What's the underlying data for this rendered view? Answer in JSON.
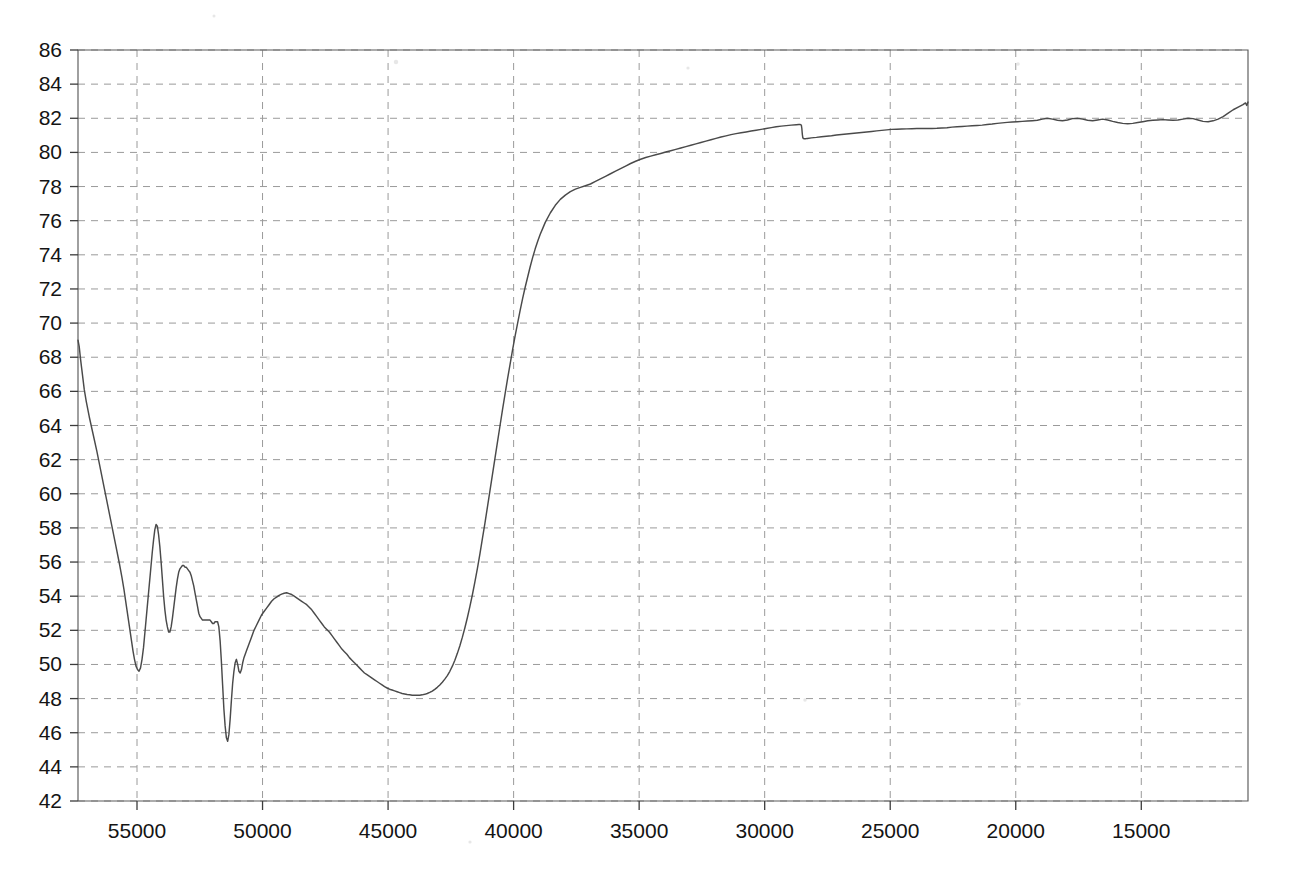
{
  "chart_data": {
    "type": "line",
    "title": "",
    "subtitle": "",
    "xlabel": "",
    "ylabel": "",
    "xlim": [
      57350,
      10750
    ],
    "ylim": [
      42,
      86
    ],
    "x_axis_reversed": true,
    "grid": true,
    "legend": null,
    "legend_position": "none",
    "x_ticks": [
      55000,
      50000,
      45000,
      40000,
      35000,
      30000,
      25000,
      20000,
      15000
    ],
    "x_tick_labels": [
      "55000",
      "50000",
      "45000",
      "40000",
      "35000",
      "30000",
      "25000",
      "20000",
      "15000"
    ],
    "y_ticks": [
      42,
      44,
      46,
      48,
      50,
      52,
      54,
      56,
      58,
      60,
      62,
      64,
      66,
      68,
      70,
      72,
      74,
      76,
      78,
      80,
      82,
      84,
      86
    ],
    "y_tick_labels": [
      "42",
      "44",
      "46",
      "48",
      "50",
      "52",
      "54",
      "56",
      "58",
      "60",
      "62",
      "64",
      "66",
      "68",
      "70",
      "72",
      "74",
      "76",
      "78",
      "80",
      "82",
      "84",
      "86"
    ],
    "annotations": [
      {
        "text": "step discontinuity",
        "x": 28500,
        "y": 81.0
      }
    ],
    "series": [
      {
        "name": "transmittance",
        "color": "#4a4a4a",
        "x": [
          57350,
          57300,
          57250,
          57200,
          57150,
          57100,
          57020,
          56900,
          56750,
          56600,
          56450,
          56300,
          56150,
          56000,
          55850,
          55700,
          55600,
          55520,
          55460,
          55400,
          55340,
          55280,
          55220,
          55160,
          55100,
          55040,
          54980,
          54920,
          54860,
          54800,
          54740,
          54690,
          54640,
          54590,
          54540,
          54490,
          54440,
          54390,
          54340,
          54290,
          54240,
          54190,
          54140,
          54090,
          54040,
          53990,
          53940,
          53890,
          53840,
          53790,
          53740,
          53690,
          53640,
          53590,
          53540,
          53490,
          53440,
          53390,
          53340,
          53290,
          53240,
          53190,
          53140,
          53090,
          53040,
          52990,
          52940,
          52890,
          52840,
          52790,
          52740,
          52690,
          52640,
          52590,
          52540,
          52490,
          52440,
          52390,
          52340,
          52290,
          52240,
          52190,
          52140,
          52090,
          52040,
          51990,
          51940,
          51890,
          51840,
          51790,
          51740,
          51690,
          51640,
          51590,
          51540,
          51490,
          51440,
          51390,
          51340,
          51290,
          51240,
          51190,
          51140,
          51090,
          51040,
          50990,
          50940,
          50890,
          50840,
          50790,
          50740,
          50640,
          50540,
          50440,
          50340,
          50240,
          50140,
          50040,
          49940,
          49840,
          49740,
          49640,
          49540,
          49440,
          49340,
          49240,
          49140,
          49040,
          48940,
          48840,
          48740,
          48640,
          48540,
          48440,
          48340,
          48240,
          48140,
          48040,
          47940,
          47840,
          47740,
          47640,
          47540,
          47440,
          47340,
          47240,
          47140,
          47040,
          46940,
          46840,
          46740,
          46640,
          46540,
          46440,
          46340,
          46240,
          46140,
          46040,
          45940,
          45840,
          45740,
          45640,
          45540,
          45440,
          45340,
          45240,
          45140,
          45040,
          44940,
          44840,
          44740,
          44640,
          44540,
          44440,
          44340,
          44240,
          44140,
          44040,
          43940,
          43840,
          43740,
          43640,
          43540,
          43440,
          43340,
          43240,
          43140,
          43040,
          42940,
          42840,
          42740,
          42640,
          42540,
          42440,
          42340,
          42240,
          42140,
          42040,
          41940,
          41840,
          41740,
          41640,
          41540,
          41440,
          41340,
          41240,
          41140,
          41040,
          40940,
          40840,
          40740,
          40640,
          40540,
          40440,
          40340,
          40240,
          40140,
          40040,
          39940,
          39840,
          39740,
          39640,
          39540,
          39440,
          39340,
          39240,
          39140,
          39040,
          38940,
          38840,
          38740,
          38540,
          38340,
          38140,
          37940,
          37740,
          37540,
          37340,
          37140,
          36940,
          36740,
          36540,
          36340,
          36140,
          35940,
          35740,
          35540,
          35340,
          35140,
          34940,
          34740,
          34540,
          34340,
          34140,
          33940,
          33740,
          33540,
          33340,
          33140,
          32940,
          32740,
          32540,
          32340,
          32140,
          31940,
          31740,
          31540,
          31340,
          31140,
          30940,
          30740,
          30540,
          30340,
          30140,
          29940,
          29740,
          29540,
          29340,
          29140,
          28940,
          28740,
          28640,
          28580,
          28540,
          28520,
          28500,
          28480,
          28440,
          28380,
          28300,
          28140,
          27940,
          27740,
          27540,
          27340,
          27140,
          26940,
          26740,
          26540,
          26340,
          26140,
          25940,
          25740,
          25540,
          25340,
          25140,
          24940,
          24740,
          24540,
          24340,
          24140,
          23940,
          23740,
          23540,
          23340,
          23140,
          22940,
          22740,
          22540,
          22340,
          22140,
          21940,
          21740,
          21540,
          21340,
          21140,
          20940,
          20740,
          20540,
          20340,
          20140,
          19940,
          19740,
          19540,
          19340,
          19140,
          18940,
          18740,
          18540,
          18340,
          18140,
          17940,
          17740,
          17540,
          17340,
          17140,
          16940,
          16740,
          16540,
          16340,
          16140,
          15940,
          15740,
          15540,
          15340,
          15140,
          14940,
          14740,
          14540,
          14340,
          14140,
          13940,
          13740,
          13540,
          13340,
          13140,
          12940,
          12740,
          12540,
          12340,
          12140,
          11940,
          11740,
          11540,
          11340,
          11140,
          10950,
          10850,
          10800,
          10750
        ],
        "y": [
          69.0,
          68.6,
          67.9,
          67.3,
          66.7,
          66.1,
          65.4,
          64.5,
          63.5,
          62.5,
          61.4,
          60.3,
          59.2,
          58.1,
          57.0,
          55.9,
          55.1,
          54.4,
          53.8,
          53.2,
          52.6,
          52.0,
          51.4,
          50.8,
          50.3,
          49.9,
          49.7,
          49.6,
          49.8,
          50.3,
          51.0,
          51.8,
          52.6,
          53.4,
          54.2,
          55.0,
          55.8,
          56.6,
          57.3,
          57.9,
          58.2,
          58.1,
          57.6,
          56.9,
          56.0,
          55.0,
          54.0,
          53.2,
          52.6,
          52.2,
          51.9,
          51.9,
          52.2,
          52.7,
          53.3,
          53.9,
          54.5,
          55.0,
          55.4,
          55.6,
          55.7,
          55.8,
          55.8,
          55.7,
          55.7,
          55.6,
          55.5,
          55.4,
          55.2,
          54.9,
          54.6,
          54.2,
          53.8,
          53.4,
          53.0,
          52.8,
          52.7,
          52.6,
          52.6,
          52.6,
          52.6,
          52.6,
          52.6,
          52.6,
          52.5,
          52.4,
          52.4,
          52.5,
          52.5,
          52.5,
          52.2,
          51.4,
          50.2,
          48.8,
          47.4,
          46.4,
          45.7,
          45.5,
          45.9,
          46.8,
          47.9,
          48.9,
          49.6,
          50.1,
          50.3,
          50.0,
          49.6,
          49.5,
          49.7,
          50.1,
          50.4,
          50.8,
          51.2,
          51.6,
          52.0,
          52.3,
          52.6,
          52.9,
          53.1,
          53.3,
          53.5,
          53.7,
          53.85,
          53.95,
          54.05,
          54.12,
          54.17,
          54.2,
          54.15,
          54.1,
          54.0,
          53.9,
          53.8,
          53.7,
          53.6,
          53.5,
          53.35,
          53.2,
          53.0,
          52.8,
          52.6,
          52.4,
          52.2,
          52.05,
          51.9,
          51.7,
          51.5,
          51.3,
          51.1,
          50.9,
          50.75,
          50.6,
          50.4,
          50.25,
          50.1,
          49.95,
          49.8,
          49.65,
          49.5,
          49.4,
          49.3,
          49.2,
          49.1,
          49.0,
          48.9,
          48.8,
          48.7,
          48.62,
          48.55,
          48.5,
          48.45,
          48.4,
          48.35,
          48.3,
          48.27,
          48.24,
          48.22,
          48.2,
          48.2,
          48.2,
          48.2,
          48.22,
          48.25,
          48.3,
          48.36,
          48.44,
          48.54,
          48.66,
          48.8,
          48.96,
          49.14,
          49.35,
          49.6,
          49.9,
          50.25,
          50.65,
          51.1,
          51.6,
          52.15,
          52.75,
          53.4,
          54.1,
          54.85,
          55.65,
          56.5,
          57.4,
          58.3,
          59.25,
          60.2,
          61.15,
          62.1,
          63.05,
          64.0,
          64.95,
          65.85,
          66.75,
          67.6,
          68.45,
          69.25,
          70.0,
          70.75,
          71.45,
          72.1,
          72.7,
          73.3,
          73.85,
          74.35,
          74.8,
          75.2,
          75.55,
          75.9,
          76.45,
          76.9,
          77.25,
          77.5,
          77.7,
          77.85,
          77.95,
          78.05,
          78.15,
          78.3,
          78.45,
          78.6,
          78.75,
          78.9,
          79.05,
          79.2,
          79.35,
          79.48,
          79.6,
          79.7,
          79.78,
          79.86,
          79.94,
          80.02,
          80.1,
          80.18,
          80.26,
          80.34,
          80.42,
          80.5,
          80.58,
          80.66,
          80.74,
          80.82,
          80.9,
          80.97,
          81.04,
          81.1,
          81.15,
          81.2,
          81.25,
          81.3,
          81.35,
          81.4,
          81.45,
          81.5,
          81.54,
          81.57,
          81.6,
          81.62,
          81.63,
          81.63,
          81.6,
          81.4,
          81.05,
          80.85,
          80.8,
          80.8,
          80.82,
          80.85,
          80.88,
          80.92,
          80.95,
          80.98,
          81.02,
          81.05,
          81.08,
          81.11,
          81.14,
          81.17,
          81.2,
          81.23,
          81.26,
          81.29,
          81.32,
          81.35,
          81.36,
          81.37,
          81.38,
          81.39,
          81.4,
          81.4,
          81.4,
          81.4,
          81.41,
          81.43,
          81.45,
          81.48,
          81.5,
          81.52,
          81.54,
          81.56,
          81.58,
          81.6,
          81.63,
          81.66,
          81.7,
          81.73,
          81.76,
          81.78,
          81.8,
          81.82,
          81.84,
          81.86,
          81.88,
          81.95,
          82.0,
          81.95,
          81.88,
          81.85,
          81.9,
          81.98,
          82.0,
          81.95,
          81.88,
          81.85,
          81.9,
          81.95,
          81.9,
          81.82,
          81.75,
          81.7,
          81.68,
          81.7,
          81.75,
          81.8,
          81.85,
          81.88,
          81.9,
          81.92,
          81.9,
          81.88,
          81.9,
          81.95,
          82.0,
          81.98,
          81.9,
          81.82,
          81.8,
          81.85,
          81.95,
          82.1,
          82.3,
          82.5,
          82.65,
          82.8,
          82.9,
          82.75,
          82.95
        ]
      }
    ]
  },
  "figure": {
    "background_color": "#ffffff",
    "line_color": "#4a4a4a",
    "grid_color": "#9a9a9a",
    "frame_color": "#5a5a5a",
    "text_color": "#141414"
  }
}
